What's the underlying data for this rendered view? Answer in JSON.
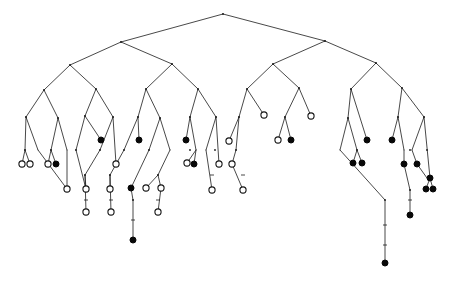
{
  "figure": {
    "type": "dendrogram",
    "width": 449,
    "height": 284,
    "background_color": "#ffffff",
    "edge_color": "#1a1a1a",
    "open_leaf_fill": "#ffffff",
    "open_leaf_stroke": "#151515",
    "filled_leaf_fill": "#080808",
    "leaf_radius_open": 3.1,
    "leaf_radius_filled": 3.0,
    "internal_dot_radius": 0.9,
    "counts": {
      "open_leaves": 30,
      "filled_leaves": 25,
      "total_leaves": 55
    }
  },
  "chart_data": {
    "type": "tree",
    "title": "",
    "xlabel": "",
    "ylabel": "",
    "root": {
      "id": "root",
      "x": 223,
      "y": 14
    },
    "internal_nodes": [
      {
        "id": "n_root",
        "x": 223,
        "y": 14
      },
      {
        "id": "n_L",
        "x": 121,
        "y": 42
      },
      {
        "id": "n_R",
        "x": 325,
        "y": 41
      },
      {
        "id": "n_LL",
        "x": 70,
        "y": 65
      },
      {
        "id": "n_LR",
        "x": 172,
        "y": 64
      },
      {
        "id": "n_RL",
        "x": 273,
        "y": 64
      },
      {
        "id": "n_RR",
        "x": 376,
        "y": 63
      },
      {
        "id": "n_LLL",
        "x": 44,
        "y": 90
      },
      {
        "id": "n_LLR",
        "x": 96,
        "y": 89
      },
      {
        "id": "n_LRL",
        "x": 146,
        "y": 89
      },
      {
        "id": "n_LRR",
        "x": 198,
        "y": 89
      },
      {
        "id": "n_RLL",
        "x": 247,
        "y": 89
      },
      {
        "id": "n_RLR",
        "x": 299,
        "y": 88
      },
      {
        "id": "n_RRL",
        "x": 351,
        "y": 89
      },
      {
        "id": "n_RRR",
        "x": 402,
        "y": 88
      },
      {
        "id": "n_a1",
        "x": 26,
        "y": 117
      },
      {
        "id": "n_a2",
        "x": 58,
        "y": 118
      },
      {
        "id": "n_b1",
        "x": 85,
        "y": 116
      },
      {
        "id": "n_b2",
        "x": 113,
        "y": 117
      },
      {
        "id": "n_c1",
        "x": 138,
        "y": 117
      },
      {
        "id": "n_c2",
        "x": 160,
        "y": 118
      },
      {
        "id": "n_d1",
        "x": 190,
        "y": 117
      },
      {
        "id": "n_d2",
        "x": 216,
        "y": 117
      },
      {
        "id": "n_e1",
        "x": 239,
        "y": 117
      },
      {
        "id": "n_f1",
        "x": 285,
        "y": 117
      },
      {
        "id": "n_g1",
        "x": 348,
        "y": 118
      },
      {
        "id": "n_h1",
        "x": 398,
        "y": 117
      },
      {
        "id": "n_h2",
        "x": 424,
        "y": 117
      },
      {
        "id": "n_i1",
        "x": 25,
        "y": 150
      },
      {
        "id": "n_i2",
        "x": 51,
        "y": 150
      },
      {
        "id": "n_i3",
        "x": 76,
        "y": 150
      },
      {
        "id": "n_i4",
        "x": 100,
        "y": 150
      },
      {
        "id": "n_i5",
        "x": 124,
        "y": 150
      },
      {
        "id": "n_i6",
        "x": 149,
        "y": 150
      },
      {
        "id": "n_i7",
        "x": 190,
        "y": 150
      },
      {
        "id": "n_i8",
        "x": 215,
        "y": 150
      },
      {
        "id": "n_i9",
        "x": 236,
        "y": 150
      },
      {
        "id": "n_i10",
        "x": 357,
        "y": 150
      },
      {
        "id": "n_i11",
        "x": 410,
        "y": 150
      },
      {
        "id": "n_i12",
        "x": 427,
        "y": 150
      },
      {
        "id": "n_j1",
        "x": 85,
        "y": 175
      },
      {
        "id": "n_j2",
        "x": 110,
        "y": 175
      },
      {
        "id": "n_j3",
        "x": 133,
        "y": 200
      },
      {
        "id": "n_j4",
        "x": 158,
        "y": 175
      },
      {
        "id": "n_j5",
        "x": 385,
        "y": 200
      },
      {
        "id": "n_j6",
        "x": 410,
        "y": 190
      },
      {
        "id": "n_j7",
        "x": 430,
        "y": 178
      }
    ],
    "leaves": [
      {
        "id": "lf1",
        "x": 22,
        "y": 164,
        "state": "open",
        "parent": "n_i1"
      },
      {
        "id": "lf2",
        "x": 30,
        "y": 164,
        "state": "open",
        "parent": "n_i1"
      },
      {
        "id": "lf3",
        "x": 48,
        "y": 164,
        "state": "open",
        "parent": "n_i2"
      },
      {
        "id": "lf4",
        "x": 56,
        "y": 164,
        "state": "filled",
        "parent": "n_i2"
      },
      {
        "id": "lf5",
        "x": 67,
        "y": 189,
        "state": "open",
        "parent": "n_i3"
      },
      {
        "id": "lf6",
        "x": 86,
        "y": 189,
        "state": "open",
        "parent": "n_i4"
      },
      {
        "id": "lf7",
        "x": 86,
        "y": 212,
        "state": "open",
        "parent": "n_j1"
      },
      {
        "id": "lf8",
        "x": 101,
        "y": 140,
        "state": "filled",
        "parent": "n_b2"
      },
      {
        "id": "lf9",
        "x": 110,
        "y": 189,
        "state": "open",
        "parent": "n_i5"
      },
      {
        "id": "lf10",
        "x": 111,
        "y": 212,
        "state": "open",
        "parent": "n_j2"
      },
      {
        "id": "lf11",
        "x": 116,
        "y": 164,
        "state": "open",
        "parent": "n_c1"
      },
      {
        "id": "lf12",
        "x": 131,
        "y": 188,
        "state": "filled",
        "parent": "n_i6"
      },
      {
        "id": "lf13",
        "x": 133,
        "y": 240,
        "state": "filled",
        "parent": "n_j3"
      },
      {
        "id": "lf14",
        "x": 139,
        "y": 140,
        "state": "filled",
        "parent": "n_c2"
      },
      {
        "id": "lf15",
        "x": 146,
        "y": 188,
        "state": "open",
        "parent": "n_i7"
      },
      {
        "id": "lf16",
        "x": 161,
        "y": 188,
        "state": "open",
        "parent": "n_j4"
      },
      {
        "id": "lf17",
        "x": 158,
        "y": 212,
        "state": "open",
        "parent": "n_i8"
      },
      {
        "id": "lf18",
        "x": 186,
        "y": 140,
        "state": "filled",
        "parent": "n_d1"
      },
      {
        "id": "lf19",
        "x": 187,
        "y": 163,
        "state": "open",
        "parent": "n_i7"
      },
      {
        "id": "lf20",
        "x": 194,
        "y": 164,
        "state": "filled",
        "parent": "n_i7"
      },
      {
        "id": "lf21",
        "x": 212,
        "y": 190,
        "state": "open",
        "parent": "n_i8"
      },
      {
        "id": "lf22",
        "x": 219,
        "y": 164,
        "state": "open",
        "parent": "n_d2"
      },
      {
        "id": "lf23",
        "x": 229,
        "y": 141,
        "state": "open",
        "parent": "n_e1"
      },
      {
        "id": "lf24",
        "x": 232,
        "y": 164,
        "state": "open",
        "parent": "n_i9"
      },
      {
        "id": "lf25",
        "x": 243,
        "y": 190,
        "state": "open",
        "parent": "n_i9"
      },
      {
        "id": "lf26",
        "x": 264,
        "y": 115,
        "state": "open",
        "parent": "n_RLL"
      },
      {
        "id": "lf27",
        "x": 278,
        "y": 140,
        "state": "open",
        "parent": "n_f1"
      },
      {
        "id": "lf28",
        "x": 291,
        "y": 140,
        "state": "filled",
        "parent": "n_f1"
      },
      {
        "id": "lf29",
        "x": 311,
        "y": 116,
        "state": "open",
        "parent": "n_RLR"
      },
      {
        "id": "lf30",
        "x": 353,
        "y": 163,
        "state": "filled",
        "parent": "n_i10"
      },
      {
        "id": "lf31",
        "x": 362,
        "y": 163,
        "state": "filled",
        "parent": "n_i10"
      },
      {
        "id": "lf32",
        "x": 367,
        "y": 140,
        "state": "filled",
        "parent": "n_g1"
      },
      {
        "id": "lf33",
        "x": 385,
        "y": 263,
        "state": "filled",
        "parent": "n_j5"
      },
      {
        "id": "lf34",
        "x": 392,
        "y": 140,
        "state": "filled",
        "parent": "n_h1"
      },
      {
        "id": "lf35",
        "x": 404,
        "y": 164,
        "state": "filled",
        "parent": "n_i11"
      },
      {
        "id": "lf36",
        "x": 410,
        "y": 215,
        "state": "filled",
        "parent": "n_j6"
      },
      {
        "id": "lf37",
        "x": 417,
        "y": 164,
        "state": "filled",
        "parent": "n_i12"
      },
      {
        "id": "lf38",
        "x": 426,
        "y": 189,
        "state": "filled",
        "parent": "n_j7"
      },
      {
        "id": "lf39",
        "x": 433,
        "y": 189,
        "state": "filled",
        "parent": "n_j7"
      },
      {
        "id": "lf40",
        "x": 430,
        "y": 178,
        "state": "filled",
        "parent": "n_h2"
      }
    ],
    "edges": [
      [
        223,
        14,
        121,
        42
      ],
      [
        223,
        14,
        325,
        41
      ],
      [
        121,
        42,
        70,
        65
      ],
      [
        121,
        42,
        172,
        64
      ],
      [
        325,
        41,
        273,
        64
      ],
      [
        325,
        41,
        376,
        63
      ],
      [
        70,
        65,
        44,
        90
      ],
      [
        70,
        65,
        96,
        89
      ],
      [
        172,
        64,
        146,
        89
      ],
      [
        172,
        64,
        198,
        89
      ],
      [
        273,
        64,
        247,
        89
      ],
      [
        273,
        64,
        299,
        88
      ],
      [
        376,
        63,
        351,
        89
      ],
      [
        376,
        63,
        402,
        88
      ],
      [
        44,
        90,
        26,
        117
      ],
      [
        44,
        90,
        58,
        118
      ],
      [
        96,
        89,
        85,
        116
      ],
      [
        96,
        89,
        113,
        117
      ],
      [
        146,
        89,
        138,
        117
      ],
      [
        146,
        89,
        160,
        118
      ],
      [
        198,
        89,
        190,
        117
      ],
      [
        198,
        89,
        216,
        117
      ],
      [
        247,
        89,
        239,
        117
      ],
      [
        247,
        89,
        264,
        115
      ],
      [
        299,
        88,
        285,
        117
      ],
      [
        299,
        88,
        311,
        116
      ],
      [
        351,
        89,
        348,
        118
      ],
      [
        351,
        89,
        367,
        140
      ],
      [
        402,
        88,
        398,
        117
      ],
      [
        402,
        88,
        424,
        117
      ],
      [
        26,
        117,
        25,
        150
      ],
      [
        26,
        117,
        38,
        150
      ],
      [
        58,
        118,
        51,
        150
      ],
      [
        58,
        118,
        67,
        150
      ],
      [
        85,
        116,
        76,
        150
      ],
      [
        85,
        116,
        101,
        140
      ],
      [
        113,
        117,
        100,
        150
      ],
      [
        113,
        117,
        116,
        164
      ],
      [
        138,
        117,
        124,
        150
      ],
      [
        138,
        117,
        139,
        140
      ],
      [
        160,
        118,
        149,
        150
      ],
      [
        160,
        118,
        170,
        150
      ],
      [
        190,
        117,
        186,
        140
      ],
      [
        190,
        117,
        196,
        150
      ],
      [
        216,
        117,
        206,
        150
      ],
      [
        216,
        117,
        219,
        164
      ],
      [
        239,
        117,
        229,
        141
      ],
      [
        239,
        117,
        236,
        150
      ],
      [
        285,
        117,
        278,
        140
      ],
      [
        285,
        117,
        291,
        140
      ],
      [
        348,
        118,
        357,
        150
      ],
      [
        348,
        118,
        340,
        150
      ],
      [
        398,
        117,
        392,
        140
      ],
      [
        398,
        117,
        404,
        150
      ],
      [
        424,
        117,
        412,
        150
      ],
      [
        424,
        117,
        430,
        178
      ],
      [
        25,
        150,
        22,
        164
      ],
      [
        25,
        150,
        30,
        164
      ],
      [
        51,
        150,
        48,
        164
      ],
      [
        51,
        150,
        56,
        164
      ],
      [
        38,
        150,
        67,
        189
      ],
      [
        67,
        150,
        67,
        189
      ],
      [
        76,
        150,
        86,
        189
      ],
      [
        100,
        150,
        85,
        175
      ],
      [
        85,
        175,
        86,
        189
      ],
      [
        85,
        175,
        86,
        212
      ],
      [
        124,
        150,
        110,
        175
      ],
      [
        110,
        175,
        110,
        189
      ],
      [
        110,
        175,
        111,
        212
      ],
      [
        149,
        150,
        131,
        188
      ],
      [
        131,
        188,
        133,
        200
      ],
      [
        133,
        200,
        133,
        240
      ],
      [
        170,
        150,
        158,
        175
      ],
      [
        158,
        175,
        146,
        188
      ],
      [
        158,
        175,
        161,
        188
      ],
      [
        161,
        188,
        158,
        212
      ],
      [
        196,
        150,
        187,
        163
      ],
      [
        196,
        150,
        194,
        164
      ],
      [
        206,
        150,
        212,
        190
      ],
      [
        236,
        150,
        232,
        164
      ],
      [
        232,
        164,
        243,
        190
      ],
      [
        357,
        150,
        353,
        163
      ],
      [
        357,
        150,
        362,
        163
      ],
      [
        404,
        150,
        404,
        164
      ],
      [
        404,
        164,
        410,
        190
      ],
      [
        410,
        190,
        410,
        215
      ],
      [
        412,
        150,
        417,
        164
      ],
      [
        417,
        164,
        427,
        178
      ],
      [
        430,
        178,
        426,
        189
      ],
      [
        430,
        178,
        433,
        189
      ],
      [
        340,
        150,
        385,
        200
      ],
      [
        385,
        200,
        385,
        263
      ]
    ],
    "branch_ticks": [
      {
        "x": 133,
        "y": 220
      },
      {
        "x": 385,
        "y": 225
      },
      {
        "x": 385,
        "y": 245
      },
      {
        "x": 410,
        "y": 200
      },
      {
        "x": 86,
        "y": 200
      },
      {
        "x": 111,
        "y": 200
      },
      {
        "x": 158,
        "y": 200
      },
      {
        "x": 212,
        "y": 175
      },
      {
        "x": 243,
        "y": 175
      }
    ]
  }
}
